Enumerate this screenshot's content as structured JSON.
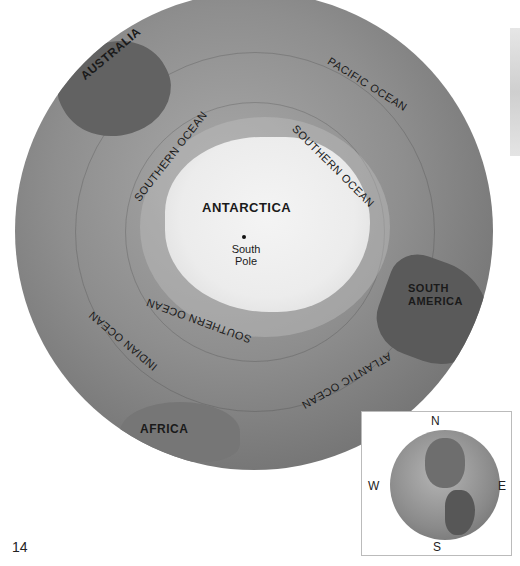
{
  "map": {
    "title": "Southern hemisphere globe view",
    "labels": {
      "australia": "AUSTRALIA",
      "pacific_ocean": "PACIFIC OCEAN",
      "southern_ocean_nw": "SOUTHERN OCEAN",
      "southern_ocean_ne": "SOUTHERN OCEAN",
      "southern_ocean_s": "SOUTHERN OCEAN",
      "antarctica": "ANTARCTICA",
      "south_pole": "South Pole",
      "south_america_1": "SOUTH",
      "south_america_2": "AMERICA",
      "indian_ocean": "INDIAN OCEAN",
      "atlantic_ocean": "ATLANTIC OCEAN",
      "africa": "AFRICA"
    }
  },
  "inset": {
    "compass": {
      "n": "N",
      "s": "S",
      "e": "E",
      "w": "W"
    }
  },
  "page": {
    "number": "14"
  }
}
